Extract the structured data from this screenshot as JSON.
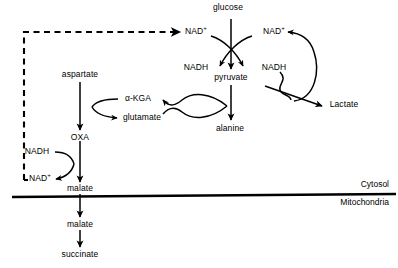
{
  "diagram": {
    "type": "biochemical-pathway",
    "stroke_color": "#000000",
    "background_color": "#ffffff",
    "nodes": [
      {
        "id": "glucose",
        "label": "glucose",
        "x": 228,
        "y": 10,
        "align": "center"
      },
      {
        "id": "nad_left",
        "label": "NAD",
        "sup": "+",
        "x": 196,
        "y": 32,
        "align": "center"
      },
      {
        "id": "nad_right",
        "label": "NAD",
        "sup": "+",
        "x": 272,
        "y": 32,
        "align": "center"
      },
      {
        "id": "nadh_left",
        "label": "NADH",
        "x": 196,
        "y": 68,
        "align": "center"
      },
      {
        "id": "nadh_right",
        "label": "NADH",
        "x": 272,
        "y": 68,
        "align": "center"
      },
      {
        "id": "pyruvate",
        "label": "pyruvate",
        "x": 231,
        "y": 78,
        "align": "center"
      },
      {
        "id": "lactate",
        "label": "Lactate",
        "x": 338,
        "y": 104,
        "align": "center"
      },
      {
        "id": "aspartate",
        "label": "aspartate",
        "x": 80,
        "y": 76,
        "align": "center"
      },
      {
        "id": "akga",
        "label": "α-KGA",
        "x": 135,
        "y": 97,
        "align": "center"
      },
      {
        "id": "glutamate",
        "label": "glutamate",
        "x": 139,
        "y": 120,
        "align": "center"
      },
      {
        "id": "oxa",
        "label": "OXA",
        "x": 80,
        "y": 137,
        "align": "center"
      },
      {
        "id": "alanine",
        "label": "alanine",
        "x": 230,
        "y": 128,
        "align": "center"
      },
      {
        "id": "nadh_oxa",
        "label": "NADH",
        "x": 37,
        "y": 152,
        "align": "center"
      },
      {
        "id": "nad_malate",
        "label": "NAD",
        "sup": "+",
        "x": 38,
        "y": 180,
        "align": "center"
      },
      {
        "id": "malate_cyt",
        "label": "malate",
        "x": 80,
        "y": 189,
        "align": "center"
      },
      {
        "id": "malate_mit",
        "label": "malate",
        "x": 80,
        "y": 225,
        "align": "center"
      },
      {
        "id": "succinate",
        "label": "succinate",
        "x": 80,
        "y": 255,
        "align": "center"
      }
    ],
    "compartments": [
      {
        "id": "cytosol",
        "label": "Cytosol",
        "x": 389,
        "y": 184
      },
      {
        "id": "mitochondria",
        "label": "Mitochondria",
        "x": 389,
        "y": 200
      }
    ],
    "membrane": {
      "y": 197,
      "x1": 12,
      "x2": 396
    },
    "feedback_arrow": {
      "label": "dashed-recycle-path",
      "from": "NAD+ (malate side)",
      "to": "NAD+ (glucose side)"
    }
  }
}
